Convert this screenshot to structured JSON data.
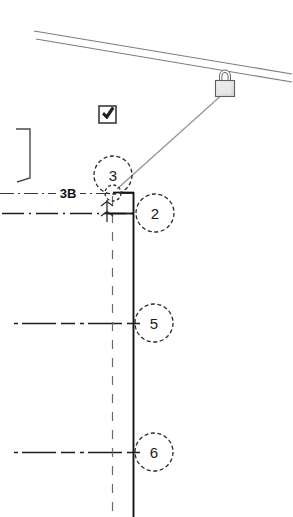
{
  "drawing": {
    "title": "Architectural wall-to-roof connection detail",
    "background_color": "#ffffff",
    "line_color": "#1a1a1a",
    "thin_line_color": "#6e6e6e",
    "centerline_color": "#333333",
    "leader_color": "#8a8a8a",
    "width": 293,
    "height": 517
  },
  "callouts": [
    {
      "id": "callout-3",
      "label": "3",
      "cx": 113,
      "cy": 175,
      "r": 19,
      "style": "dashed"
    },
    {
      "id": "callout-2",
      "label": "2",
      "cx": 155,
      "cy": 213,
      "r": 19,
      "style": "dashed"
    },
    {
      "id": "callout-5",
      "label": "5",
      "cx": 154,
      "cy": 323,
      "r": 19,
      "style": "dashed"
    },
    {
      "id": "callout-6",
      "label": "6",
      "cx": 154,
      "cy": 452,
      "r": 19,
      "style": "dashed"
    },
    {
      "id": "callout-node",
      "label": "",
      "cx": 113,
      "cy": 193,
      "r": 8,
      "style": "dashed"
    }
  ],
  "labels": {
    "centerline_tag": "3B"
  },
  "icons": {
    "padlock": {
      "name": "padlock-icon",
      "x": 215,
      "y": 68,
      "width": 20,
      "height": 24
    },
    "checkbox": {
      "name": "checkbox-checked-icon",
      "x": 98,
      "y": 105,
      "size": 18,
      "checked": true
    }
  },
  "geometry": {
    "roof_line_upper": {
      "x1": 34,
      "y1": 31,
      "x2": 292,
      "y2": 74
    },
    "roof_line_lower": {
      "x1": 36,
      "y1": 38,
      "x2": 292,
      "y2": 81
    },
    "leader_from_padlock": {
      "x1": 225,
      "y1": 92,
      "x2": 118,
      "y2": 188
    },
    "wall_line": {
      "x1": 133,
      "y1": 193,
      "x2": 133,
      "y2": 517
    },
    "wall_centerline": {
      "x1": 112,
      "y1": 196,
      "x2": 112,
      "y2": 517
    },
    "bracket": {
      "x": 15,
      "y": 128,
      "width": 16,
      "height": 52
    },
    "horizontal_centerlines": [
      {
        "id": "centerline-top",
        "y": 193,
        "x1": 0,
        "x2": 133
      },
      {
        "id": "centerline-second",
        "y": 213,
        "x1": 3,
        "x2": 133
      },
      {
        "id": "centerline-five",
        "y": 323,
        "x1": 14,
        "x2": 140
      },
      {
        "id": "centerline-six",
        "y": 452,
        "x1": 14,
        "x2": 140
      }
    ]
  }
}
